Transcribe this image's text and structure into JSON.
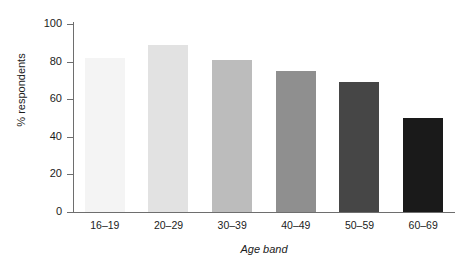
{
  "chart_data": {
    "type": "bar",
    "title": "",
    "categories": [
      "16–19",
      "20–29",
      "30–39",
      "40–49",
      "50–59",
      "60–69"
    ],
    "values": [
      82,
      89,
      81,
      75,
      69,
      50
    ],
    "bar_colors": [
      "#f4f4f4",
      "#e2e2e2",
      "#bcbcbc",
      "#8f8f8f",
      "#464646",
      "#1a1a1a"
    ],
    "xlabel": "Age band",
    "ylabel": "% respondents",
    "ylim": [
      0,
      100
    ],
    "ytick_labels": [
      "0",
      "20",
      "40",
      "60",
      "80",
      "100"
    ],
    "ytick_values": [
      0,
      20,
      40,
      60,
      80,
      100
    ],
    "grid": false,
    "legend": "none",
    "axis_color": "#6e6e6e"
  }
}
